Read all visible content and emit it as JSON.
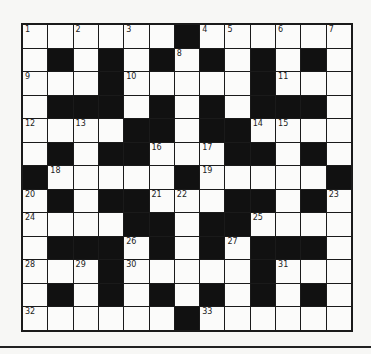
{
  "puzzle": {
    "rows": 13,
    "cols": 13,
    "layout": [
      "1.2.3.#45.6.7",
      ".#.#.#8#.#.#.",
      "9..#10....#11..",
      ".###.#.#.###.",
      "12.13.##.##1415..",
      ".#.##16.17##.#.",
      "#18....#19....#",
      "20#.##2122.##.#23",
      "2424...##.##25...",
      ".###26#.#27###.",
      "28.29#30....#31..",
      ".#.#.#.#.#.#.",
      "32.....#33....."
    ],
    "grid": [
      [
        "1",
        "",
        "2",
        "",
        "3",
        "",
        "#",
        "4",
        "5",
        "",
        "6",
        "",
        "7"
      ],
      [
        "",
        "#",
        "",
        "#",
        "",
        "#",
        "8",
        "#",
        "",
        "#",
        "",
        "#",
        ""
      ],
      [
        "9",
        "",
        "",
        "#",
        "10",
        "",
        "",
        "",
        "",
        "#",
        "11",
        "",
        ""
      ],
      [
        "",
        "#",
        "#",
        "#",
        "",
        "#",
        "",
        "#",
        "",
        "#",
        "#",
        "#",
        ""
      ],
      [
        "12",
        "",
        "13",
        "",
        "#",
        "#",
        "",
        "#",
        "#",
        "14",
        "15",
        "",
        ""
      ],
      [
        "",
        "#",
        "",
        "#",
        "#",
        "16",
        "",
        "17",
        "#",
        "#",
        "",
        "#",
        ""
      ],
      [
        "#",
        "18",
        "",
        "",
        "",
        "",
        "#",
        "19",
        "",
        "",
        "",
        "",
        "#"
      ],
      [
        "20",
        "#",
        "",
        "#",
        "#",
        "21",
        "22",
        "",
        "#",
        "#",
        "",
        "#",
        "23"
      ],
      [
        "24",
        "",
        "",
        "",
        "#",
        "#",
        "",
        "#",
        "#",
        "25",
        "",
        "",
        ""
      ],
      [
        "",
        "#",
        "#",
        "#",
        "26",
        "#",
        "",
        "#",
        "27",
        "#",
        "#",
        "#",
        ""
      ],
      [
        "28",
        "",
        "29",
        "#",
        "30",
        "",
        "",
        "",
        "",
        "#",
        "31",
        "",
        ""
      ],
      [
        "",
        "#",
        "",
        "#",
        "",
        "#",
        "",
        "#",
        "",
        "#",
        "",
        "#",
        ""
      ],
      [
        "32",
        "",
        "",
        "",
        "",
        "",
        "#",
        "33",
        "",
        "",
        "",
        "",
        ""
      ]
    ],
    "clue_numbers": [
      1,
      2,
      3,
      4,
      5,
      6,
      7,
      8,
      9,
      10,
      11,
      12,
      13,
      14,
      15,
      16,
      17,
      18,
      19,
      20,
      21,
      22,
      23,
      24,
      25,
      26,
      27,
      28,
      29,
      30,
      31,
      32,
      33
    ]
  },
  "colors": {
    "block": "#111111",
    "cell": "#fbfbfa",
    "border": "#1a1a1a"
  }
}
